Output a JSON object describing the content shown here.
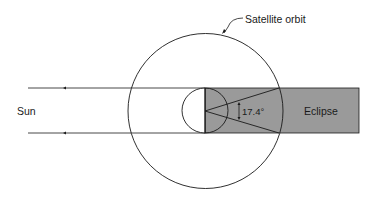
{
  "diagram": {
    "labels": {
      "orbit": "Satellite orbit",
      "sun": "Sun",
      "eclipse": "Eclipse",
      "angle": "17.4°"
    },
    "colors": {
      "shadow": "#9a9a9a",
      "line": "#1a1a1a",
      "background": "#ffffff"
    }
  }
}
